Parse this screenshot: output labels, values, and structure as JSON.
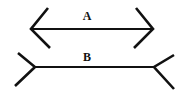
{
  "figure": {
    "lines": [
      {
        "label": "A",
        "fin_style": "inward-arrowheads"
      },
      {
        "label": "B",
        "fin_style": "outward-tails"
      }
    ]
  },
  "colors": {
    "stroke": "#111111",
    "background": "#ffffff"
  }
}
